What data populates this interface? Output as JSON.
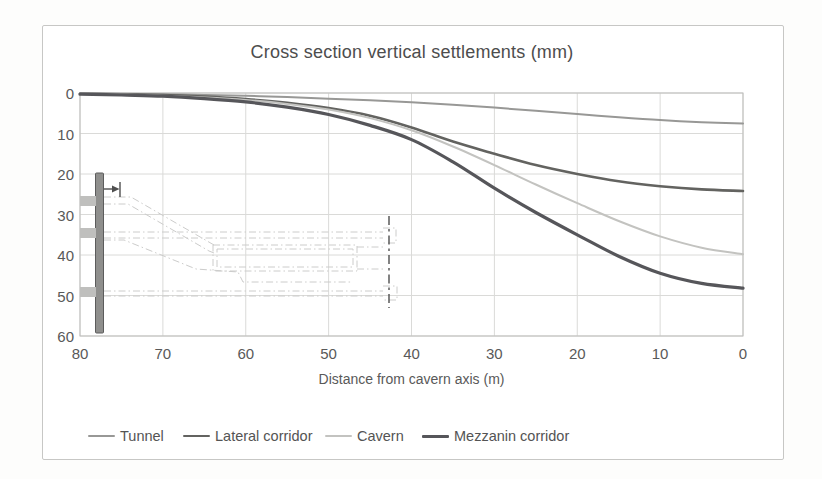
{
  "chart": {
    "title": "Cross section vertical settlements (mm)",
    "xlabel": "Distance from cavern axis (m)"
  },
  "chart_data": {
    "type": "line",
    "title": "Cross section vertical settlements (mm)",
    "xlabel": "Distance from cavern axis (m)",
    "ylabel": "",
    "x_reversed": true,
    "y_increases_downward": true,
    "x_range": [
      80,
      0
    ],
    "y_range": [
      0,
      60
    ],
    "x_ticks": [
      80,
      70,
      60,
      50,
      40,
      30,
      20,
      10,
      0
    ],
    "y_ticks": [
      0,
      10,
      20,
      30,
      40,
      50,
      60
    ],
    "grid": true,
    "legend_position": "bottom",
    "x": [
      80,
      75,
      70,
      65,
      60,
      55,
      50,
      45,
      40,
      35,
      30,
      25,
      20,
      15,
      10,
      5,
      0
    ],
    "series": [
      {
        "name": "Tunnel",
        "color": "#989896",
        "width": 2,
        "values": [
          0.2,
          0.2,
          0.3,
          0.5,
          0.7,
          1.0,
          1.4,
          1.8,
          2.3,
          2.9,
          3.6,
          4.4,
          5.2,
          6.0,
          6.7,
          7.2,
          7.5
        ]
      },
      {
        "name": "Lateral corridor",
        "color": "#636360",
        "width": 2.6,
        "values": [
          0.2,
          0.3,
          0.5,
          0.9,
          1.5,
          2.4,
          3.7,
          5.6,
          8.5,
          12.0,
          15.0,
          17.8,
          20.0,
          21.8,
          23.0,
          23.8,
          24.2
        ]
      },
      {
        "name": "Cavern",
        "color": "#c3c3c0",
        "width": 2,
        "values": [
          0.2,
          0.4,
          0.7,
          1.1,
          1.7,
          2.7,
          4.1,
          6.2,
          9.2,
          13.2,
          17.8,
          22.6,
          27.2,
          31.6,
          35.4,
          38.2,
          39.8
        ]
      },
      {
        "name": "Mezzanin corridor",
        "color": "#56565a",
        "width": 3.2,
        "values": [
          0.3,
          0.5,
          0.8,
          1.4,
          2.2,
          3.5,
          5.3,
          8.0,
          11.5,
          17.0,
          23.5,
          29.5,
          35.0,
          40.3,
          44.5,
          47.0,
          48.2
        ]
      }
    ]
  },
  "inset": {
    "description": "schematic cross-section: diaphragm wall, sloping access tunnel, cavern outline, cavern axis centerline",
    "wall_color": "#8f8f8d",
    "sketch_color": "#cccccb",
    "axis_line_color": "#4f4f4f"
  },
  "colors": {
    "grid": "#dadad8",
    "plot_border": "#bdbdbb",
    "frame_border": "#c7c7c5",
    "text": "#595959",
    "title_text": "#4d4d4d"
  }
}
